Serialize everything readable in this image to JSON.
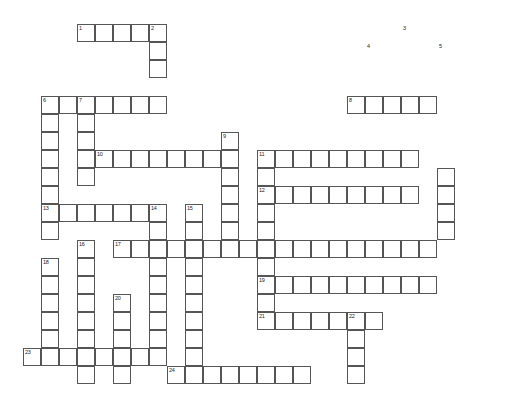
{
  "puzzle": {
    "title": "Crossword Puzzle Grid",
    "cell_size": 18,
    "origin_x": 23,
    "origin_y": 24,
    "grid_cols": 28,
    "grid_rows": 22,
    "colors": {
      "cell_fill": "#ffffff",
      "cell_border": "#555555",
      "background": "#ffffff",
      "number_color": "#222222"
    },
    "entries": [
      {
        "number": "1",
        "direction": "across",
        "col": 3,
        "row": 0,
        "length": 5
      },
      {
        "number": "2",
        "direction": "down",
        "col": 7,
        "row": 0,
        "length": 6
      },
      {
        "number": "3",
        "direction": "down",
        "col": 21,
        "row": 0,
        "length": 12
      },
      {
        "number": "4",
        "direction": "across",
        "col": 19,
        "row": 1,
        "length": 7
      },
      {
        "number": "5",
        "direction": "down",
        "col": 23,
        "row": 1,
        "length": 11
      },
      {
        "number": "6",
        "direction": "down",
        "col": 1,
        "row": 4,
        "length": 8
      },
      {
        "number": "7",
        "direction": "across",
        "col": 3,
        "row": 4,
        "length": 4
      },
      {
        "number": "7",
        "direction": "down",
        "col": 3,
        "row": 4,
        "length": 5
      },
      {
        "number": "8",
        "direction": "across",
        "col": 18,
        "row": 4,
        "length": 5
      },
      {
        "number": "9",
        "direction": "down",
        "col": 11,
        "row": 6,
        "length": 10
      },
      {
        "number": "10",
        "direction": "across",
        "col": 4,
        "row": 7,
        "length": 8
      },
      {
        "number": "11",
        "direction": "across",
        "col": 13,
        "row": 7,
        "length": 9
      },
      {
        "number": "12",
        "direction": "across",
        "col": 13,
        "row": 9,
        "length": 9
      },
      {
        "number": "13",
        "direction": "across",
        "col": 1,
        "row": 10,
        "length": 7
      },
      {
        "number": "14",
        "direction": "down",
        "col": 7,
        "row": 10,
        "length": 11
      },
      {
        "number": "15",
        "direction": "down",
        "col": 9,
        "row": 10,
        "length": 11
      },
      {
        "number": "16",
        "direction": "down",
        "col": 3,
        "row": 12,
        "length": 9
      },
      {
        "number": "17",
        "direction": "across",
        "col": 5,
        "row": 12,
        "length": 18
      },
      {
        "number": "18",
        "direction": "down",
        "col": 1,
        "row": 13,
        "length": 7
      },
      {
        "number": "19",
        "direction": "across",
        "col": 13,
        "row": 14,
        "length": 10
      },
      {
        "number": "20",
        "direction": "down",
        "col": 5,
        "row": 15,
        "length": 6
      },
      {
        "number": "21",
        "direction": "across",
        "col": 13,
        "row": 16,
        "length": 7
      },
      {
        "number": "22",
        "direction": "down",
        "col": 18,
        "row": 16,
        "length": 5
      },
      {
        "number": "23",
        "direction": "across",
        "col": 0,
        "row": 18,
        "length": 8
      },
      {
        "number": "24",
        "direction": "across",
        "col": 8,
        "row": 19,
        "length": 8
      }
    ],
    "cells": [
      [
        3,
        0
      ],
      [
        4,
        0
      ],
      [
        5,
        0
      ],
      [
        6,
        0
      ],
      [
        7,
        0
      ],
      [
        7,
        1
      ],
      [
        7,
        2
      ],
      [
        1,
        4
      ],
      [
        2,
        4
      ],
      [
        3,
        4
      ],
      [
        4,
        4
      ],
      [
        5,
        4
      ],
      [
        6,
        4
      ],
      [
        7,
        4
      ],
      [
        18,
        4
      ],
      [
        19,
        4
      ],
      [
        20,
        4
      ],
      [
        21,
        4
      ],
      [
        22,
        4
      ],
      [
        1,
        5
      ],
      [
        3,
        5
      ],
      [
        1,
        6
      ],
      [
        3,
        6
      ],
      [
        11,
        6
      ],
      [
        1,
        7
      ],
      [
        3,
        7
      ],
      [
        4,
        7
      ],
      [
        5,
        7
      ],
      [
        6,
        7
      ],
      [
        7,
        7
      ],
      [
        8,
        7
      ],
      [
        9,
        7
      ],
      [
        10,
        7
      ],
      [
        11,
        7
      ],
      [
        13,
        7
      ],
      [
        14,
        7
      ],
      [
        15,
        7
      ],
      [
        16,
        7
      ],
      [
        17,
        7
      ],
      [
        18,
        7
      ],
      [
        19,
        7
      ],
      [
        20,
        7
      ],
      [
        21,
        7
      ],
      [
        1,
        8
      ],
      [
        3,
        8
      ],
      [
        11,
        8
      ],
      [
        13,
        8
      ],
      [
        23,
        8
      ],
      [
        1,
        9
      ],
      [
        11,
        9
      ],
      [
        13,
        9
      ],
      [
        14,
        9
      ],
      [
        15,
        9
      ],
      [
        16,
        9
      ],
      [
        17,
        9
      ],
      [
        18,
        9
      ],
      [
        19,
        9
      ],
      [
        20,
        9
      ],
      [
        21,
        9
      ],
      [
        23,
        9
      ],
      [
        1,
        10
      ],
      [
        2,
        10
      ],
      [
        3,
        10
      ],
      [
        4,
        10
      ],
      [
        5,
        10
      ],
      [
        6,
        10
      ],
      [
        7,
        10
      ],
      [
        9,
        10
      ],
      [
        11,
        10
      ],
      [
        13,
        10
      ],
      [
        23,
        10
      ],
      [
        1,
        11
      ],
      [
        7,
        11
      ],
      [
        9,
        11
      ],
      [
        11,
        11
      ],
      [
        13,
        11
      ],
      [
        23,
        11
      ],
      [
        3,
        12
      ],
      [
        5,
        12
      ],
      [
        6,
        12
      ],
      [
        7,
        12
      ],
      [
        8,
        12
      ],
      [
        9,
        12
      ],
      [
        10,
        12
      ],
      [
        11,
        12
      ],
      [
        12,
        12
      ],
      [
        13,
        12
      ],
      [
        14,
        12
      ],
      [
        15,
        12
      ],
      [
        16,
        12
      ],
      [
        17,
        12
      ],
      [
        18,
        12
      ],
      [
        19,
        12
      ],
      [
        20,
        12
      ],
      [
        21,
        12
      ],
      [
        22,
        12
      ],
      [
        1,
        13
      ],
      [
        3,
        13
      ],
      [
        7,
        13
      ],
      [
        9,
        13
      ],
      [
        13,
        13
      ],
      [
        1,
        14
      ],
      [
        3,
        14
      ],
      [
        7,
        14
      ],
      [
        9,
        14
      ],
      [
        13,
        14
      ],
      [
        14,
        14
      ],
      [
        15,
        14
      ],
      [
        16,
        14
      ],
      [
        17,
        14
      ],
      [
        18,
        14
      ],
      [
        19,
        14
      ],
      [
        20,
        14
      ],
      [
        21,
        14
      ],
      [
        22,
        14
      ],
      [
        1,
        15
      ],
      [
        3,
        15
      ],
      [
        5,
        15
      ],
      [
        7,
        15
      ],
      [
        9,
        15
      ],
      [
        13,
        15
      ],
      [
        1,
        16
      ],
      [
        3,
        16
      ],
      [
        5,
        16
      ],
      [
        7,
        16
      ],
      [
        9,
        16
      ],
      [
        13,
        16
      ],
      [
        14,
        16
      ],
      [
        15,
        16
      ],
      [
        16,
        16
      ],
      [
        17,
        16
      ],
      [
        18,
        16
      ],
      [
        19,
        16
      ],
      [
        1,
        17
      ],
      [
        3,
        17
      ],
      [
        5,
        17
      ],
      [
        7,
        17
      ],
      [
        9,
        17
      ],
      [
        18,
        17
      ],
      [
        0,
        18
      ],
      [
        1,
        18
      ],
      [
        2,
        18
      ],
      [
        3,
        18
      ],
      [
        4,
        18
      ],
      [
        5,
        18
      ],
      [
        6,
        18
      ],
      [
        7,
        18
      ],
      [
        9,
        18
      ],
      [
        18,
        18
      ],
      [
        3,
        19
      ],
      [
        5,
        19
      ],
      [
        8,
        19
      ],
      [
        9,
        19
      ],
      [
        10,
        19
      ],
      [
        11,
        19
      ],
      [
        12,
        19
      ],
      [
        13,
        19
      ],
      [
        14,
        19
      ],
      [
        15,
        19
      ],
      [
        18,
        19
      ]
    ]
  }
}
